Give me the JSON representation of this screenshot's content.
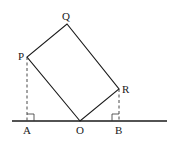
{
  "figure": {
    "type": "geometry",
    "colors": {
      "line": "#1a1a1a",
      "dashed": "#333333",
      "background": "#ffffff"
    },
    "points": {
      "P": {
        "label": "P",
        "x": 27,
        "y": 57
      },
      "Q": {
        "label": "Q",
        "x": 67,
        "y": 24
      },
      "R": {
        "label": "R",
        "x": 119,
        "y": 89
      },
      "O": {
        "label": "O",
        "x": 80,
        "y": 121
      },
      "A": {
        "label": "A",
        "x": 27,
        "y": 121
      },
      "B": {
        "label": "B",
        "x": 119,
        "y": 121
      }
    },
    "baseline": {
      "x1": 12,
      "x2": 167,
      "y": 121
    },
    "labels": {
      "P": "P",
      "Q": "Q",
      "R": "R",
      "O": "O",
      "A": "A",
      "B": "B"
    }
  }
}
